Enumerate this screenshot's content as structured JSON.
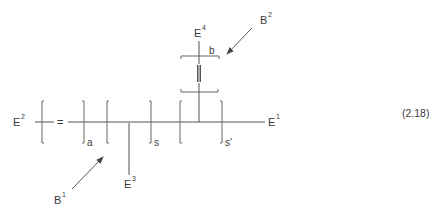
{
  "equation_number": "(2.18)",
  "labels": {
    "E1": {
      "base": "E",
      "sup": "1"
    },
    "E2": {
      "base": "E",
      "sup": "2"
    },
    "E3": {
      "base": "E",
      "sup": "3"
    },
    "E4": {
      "base": "E",
      "sup": "4"
    },
    "B1": {
      "base": "B",
      "sup": "1"
    },
    "B2": {
      "base": "B",
      "sup": "2"
    }
  },
  "repeat_units": [
    {
      "subscript": "a",
      "bond": "="
    },
    {
      "subscript": "s",
      "branch": "E3"
    },
    {
      "subscript": "s'",
      "branch": "upper bracket b"
    }
  ],
  "upper_unit": {
    "subscript": "b",
    "bond": "≡"
  },
  "colors": {
    "stroke": "#555555",
    "text": "#3a3a3a",
    "background": "#ffffff"
  }
}
